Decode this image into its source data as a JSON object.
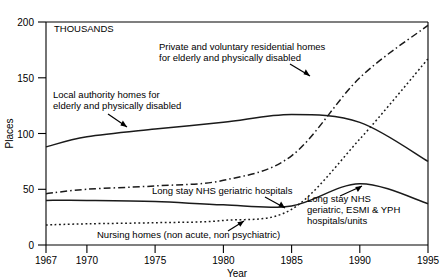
{
  "chart_data": {
    "type": "line",
    "title": "",
    "units_label": "THOUSANDS",
    "xlabel": "Year",
    "ylabel": "Places",
    "xlim": [
      1967,
      1995
    ],
    "ylim": [
      0,
      200
    ],
    "xticks": [
      1967,
      1970,
      1975,
      1980,
      1985,
      1990,
      1995
    ],
    "xtick_labels": [
      "1967",
      "1970",
      "1975",
      "1980",
      "1985",
      "1990",
      "1995"
    ],
    "yticks": [
      0,
      50,
      100,
      150,
      200
    ],
    "ytick_labels": [
      "0",
      "50",
      "100",
      "150",
      "200"
    ],
    "grid": false,
    "legend_position": "inline-annotations",
    "x": [
      1967,
      1970,
      1975,
      1980,
      1985,
      1990,
      1995
    ],
    "series": [
      {
        "name": "Local authority homes for elderly and physically disabled",
        "style": "solid",
        "values": [
          88,
          97,
          104,
          110,
          117,
          110,
          75
        ]
      },
      {
        "name": "Private and voluntary residential homes for elderly and physically disabled",
        "style": "dash-dot",
        "values": [
          46,
          50,
          53,
          58,
          80,
          150,
          197
        ]
      },
      {
        "name": "Long stay NHS geriatric hospitals",
        "style": "solid",
        "values": [
          40,
          40,
          39,
          36,
          35,
          55,
          37
        ]
      },
      {
        "name": "Nursing homes (non acute, non psychiatric)",
        "style": "dotted",
        "values": [
          18,
          19,
          20,
          22,
          32,
          95,
          167
        ]
      }
    ],
    "annotations": [
      {
        "name": "annotation-private-voluntary",
        "lines": [
          "Private and voluntary residential homes",
          "for elderly and physically disabled"
        ],
        "x": 155,
        "y": 44,
        "arrow": true
      },
      {
        "name": "annotation-local-authority",
        "lines": [
          "Local authority homes for",
          "elderly and physically disabled"
        ],
        "x": 50,
        "y": 92,
        "arrow": true
      },
      {
        "name": "annotation-long-stay-nhs-geriatric",
        "lines": [
          "Long stay NHS geriatric hospitals"
        ],
        "x": 140,
        "y": 190,
        "arrow": true
      },
      {
        "name": "annotation-nursing-homes",
        "lines": [
          "Nursing homes (non acute, non psychiatric)"
        ],
        "x": 92,
        "y": 232,
        "arrow": true
      },
      {
        "name": "annotation-long-stay-nhs-esmi-yph",
        "lines": [
          "Long stay NHS",
          "geriatric, ESMI & YPH",
          "hospitals/units"
        ],
        "x": 305,
        "y": 196,
        "arrow": true
      }
    ],
    "colors": {
      "line": "#1a1a1a",
      "axis": "#000000",
      "background": "#ffffff"
    }
  }
}
